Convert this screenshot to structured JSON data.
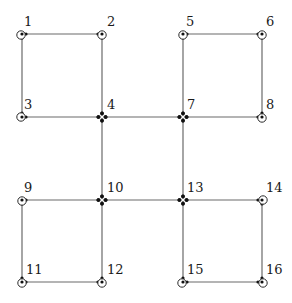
{
  "diagram": {
    "type": "graph",
    "nodes": [
      {
        "id": "1",
        "label": "1",
        "x": 22,
        "y": 34,
        "junction": false,
        "ring": {
          "dx": -1,
          "dy": 1
        },
        "label_dx": 2,
        "label_dy": -8
      },
      {
        "id": "2",
        "label": "2",
        "x": 102,
        "y": 34,
        "junction": false,
        "ring": {
          "dx": 0,
          "dy": 1
        },
        "label_dx": 5,
        "label_dy": -8
      },
      {
        "id": "3",
        "label": "3",
        "x": 22,
        "y": 117,
        "junction": false,
        "ring": {
          "dx": -1,
          "dy": 0
        },
        "label_dx": 2,
        "label_dy": -8
      },
      {
        "id": "4",
        "label": "4",
        "x": 102,
        "y": 117,
        "junction": true,
        "ring": null,
        "label_dx": 5,
        "label_dy": -8
      },
      {
        "id": "5",
        "label": "5",
        "x": 183,
        "y": 34,
        "junction": false,
        "ring": {
          "dx": 0,
          "dy": 1
        },
        "label_dx": 3,
        "label_dy": -8
      },
      {
        "id": "6",
        "label": "6",
        "x": 262,
        "y": 34,
        "junction": false,
        "ring": {
          "dx": 0,
          "dy": 1
        },
        "label_dx": 4,
        "label_dy": -8
      },
      {
        "id": "7",
        "label": "7",
        "x": 183,
        "y": 117,
        "junction": true,
        "ring": null,
        "label_dx": 4,
        "label_dy": -8
      },
      {
        "id": "8",
        "label": "8",
        "x": 262,
        "y": 117,
        "junction": false,
        "ring": {
          "dx": 0,
          "dy": 1
        },
        "label_dx": 4,
        "label_dy": -8
      },
      {
        "id": "9",
        "label": "9",
        "x": 22,
        "y": 200,
        "junction": false,
        "ring": {
          "dx": 0,
          "dy": 1
        },
        "label_dx": 2,
        "label_dy": -8
      },
      {
        "id": "10",
        "label": "10",
        "x": 102,
        "y": 200,
        "junction": true,
        "ring": null,
        "label_dx": 5,
        "label_dy": -8
      },
      {
        "id": "11",
        "label": "11",
        "x": 22,
        "y": 282,
        "junction": false,
        "ring": {
          "dx": 0,
          "dy": 1
        },
        "label_dx": 4,
        "label_dy": -8
      },
      {
        "id": "12",
        "label": "12",
        "x": 102,
        "y": 282,
        "junction": false,
        "ring": {
          "dx": 0,
          "dy": 1
        },
        "label_dx": 5,
        "label_dy": -8
      },
      {
        "id": "13",
        "label": "13",
        "x": 183,
        "y": 200,
        "junction": true,
        "ring": null,
        "label_dx": 4,
        "label_dy": -8
      },
      {
        "id": "14",
        "label": "14",
        "x": 262,
        "y": 200,
        "junction": false,
        "ring": {
          "dx": 1,
          "dy": 0
        },
        "label_dx": 4,
        "label_dy": -8
      },
      {
        "id": "15",
        "label": "15",
        "x": 183,
        "y": 282,
        "junction": false,
        "ring": {
          "dx": -1,
          "dy": 1
        },
        "label_dx": 4,
        "label_dy": -8
      },
      {
        "id": "16",
        "label": "16",
        "x": 262,
        "y": 282,
        "junction": false,
        "ring": {
          "dx": 1,
          "dy": 1
        },
        "label_dx": 4,
        "label_dy": -8
      }
    ],
    "edges": [
      [
        "1",
        "2"
      ],
      [
        "1",
        "3"
      ],
      [
        "2",
        "4"
      ],
      [
        "3",
        "4"
      ],
      [
        "5",
        "6"
      ],
      [
        "5",
        "7"
      ],
      [
        "6",
        "8"
      ],
      [
        "7",
        "8"
      ],
      [
        "4",
        "7"
      ],
      [
        "4",
        "10"
      ],
      [
        "7",
        "13"
      ],
      [
        "10",
        "13"
      ],
      [
        "9",
        "10"
      ],
      [
        "9",
        "11"
      ],
      [
        "10",
        "12"
      ],
      [
        "11",
        "12"
      ],
      [
        "13",
        "14"
      ],
      [
        "13",
        "15"
      ],
      [
        "14",
        "16"
      ],
      [
        "15",
        "16"
      ]
    ],
    "colors": {
      "edge": "#6a6a6a",
      "node": "#111111",
      "label": "#1a1a1a",
      "background": "#ffffff"
    }
  }
}
